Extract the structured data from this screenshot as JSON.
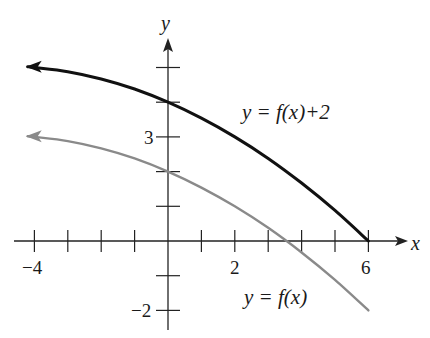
{
  "chart_data": {
    "type": "line",
    "title": "",
    "xlabel": "x",
    "ylabel": "y",
    "xlim": [
      -4.6,
      7.2
    ],
    "ylim": [
      -2.2,
      5.9
    ],
    "grid": false,
    "x_ticks": [
      -4,
      -3,
      -2,
      -1,
      0,
      1,
      2,
      3,
      4,
      5,
      6
    ],
    "x_tick_labels": [
      {
        "value": -4,
        "label": "−4"
      },
      {
        "value": 2,
        "label": "2"
      },
      {
        "value": 6,
        "label": "6"
      }
    ],
    "y_ticks": [
      -2,
      -1,
      1,
      2,
      3,
      4,
      5
    ],
    "y_tick_labels": [
      {
        "value": 3,
        "label": "3"
      },
      {
        "value": -2,
        "label": "−2"
      }
    ],
    "series": [
      {
        "name": "y = f(x)+2",
        "color": "#111111",
        "style": "solid-thick",
        "left_arrow": true,
        "x": [
          -4.2,
          -4,
          -3,
          -2,
          -1,
          0,
          1,
          2,
          3,
          4,
          5,
          6
        ],
        "y": [
          5.02,
          5.0,
          4.88,
          4.67,
          4.38,
          4.0,
          3.54,
          3.0,
          2.38,
          1.67,
          0.88,
          0.0
        ]
      },
      {
        "name": "y = f(x)",
        "color": "#8a8a8a",
        "style": "solid-gray",
        "left_arrow": true,
        "x": [
          -4.2,
          -4,
          -3,
          -2,
          -1,
          0,
          1,
          2,
          3,
          4,
          5,
          6
        ],
        "y": [
          3.02,
          3.0,
          2.88,
          2.67,
          2.38,
          2.0,
          1.54,
          1.0,
          0.38,
          -0.33,
          -1.12,
          -2.0
        ]
      }
    ],
    "annotations": [
      {
        "text": "y = f(x)+2",
        "near_series": "y = f(x)+2"
      },
      {
        "text": "y = f(x)",
        "near_series": "y = f(x)"
      }
    ]
  },
  "labels": {
    "x_axis": "x",
    "y_axis": "y",
    "upper_curve": "y = f(x)+2",
    "lower_curve": "y = f(x)",
    "tick_x_neg4": "−4",
    "tick_x_2": "2",
    "tick_x_6": "6",
    "tick_y_3": "3",
    "tick_y_neg2": "−2"
  }
}
